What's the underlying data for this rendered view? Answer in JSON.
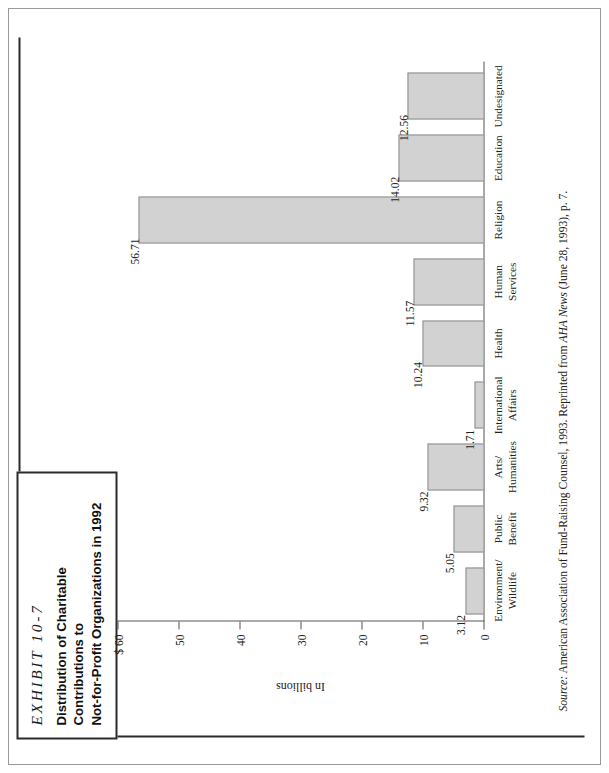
{
  "exhibit": {
    "number": "EXHIBIT 10-7",
    "title_line1": "Distribution of Charitable Contributions to",
    "title_line2": "Not-for-Profit Organizations in 1992"
  },
  "source": {
    "label": "Source:",
    "body_before_pub": " American Association of Fund-Raising Counsel, 1993. Reprinted from ",
    "publication": "AHA News",
    "body_after_pub": " (June 28, 1993), p. 7."
  },
  "chart_data": {
    "type": "bar",
    "title": "Distribution of Charitable Contributions to Not-for-Profit Organizations in 1992",
    "xlabel": "",
    "ylabel": "In billions",
    "ylim": [
      0,
      60
    ],
    "grid": false,
    "legend": "none",
    "orientation": "vertical",
    "axis_prefix": "$",
    "tick_values": [
      60,
      50,
      40,
      30,
      20,
      10,
      0
    ],
    "tick_labels": [
      "$ 60",
      "50",
      "40",
      "30",
      "20",
      "10",
      "0"
    ],
    "categories": [
      "Environment/\nWildlife",
      "Public\nBenefit",
      "Arts/\nHumanities",
      "International\nAffairs",
      "Health",
      "Human\nServices",
      "Religion",
      "Education",
      "Undesignated"
    ],
    "category_lines": [
      [
        "Environment/",
        "Wildlife"
      ],
      [
        "Public",
        "Benefit"
      ],
      [
        "Arts/",
        "Humanities"
      ],
      [
        "International",
        "Affairs"
      ],
      [
        "Health",
        ""
      ],
      [
        "Human",
        "Services"
      ],
      [
        "Religion",
        ""
      ],
      [
        "Education",
        ""
      ],
      [
        "Undesignated",
        ""
      ]
    ],
    "values": [
      3.12,
      5.05,
      9.32,
      1.71,
      10.24,
      11.57,
      56.71,
      14.02,
      12.56
    ],
    "value_labels": [
      "3.12",
      "5.05",
      "9.32",
      "1.71",
      "10.24",
      "11.57",
      "56.71",
      "14.02",
      "12.56"
    ],
    "bar_fill": "#d2d2d2",
    "bar_stroke": "#8c8c8c"
  }
}
